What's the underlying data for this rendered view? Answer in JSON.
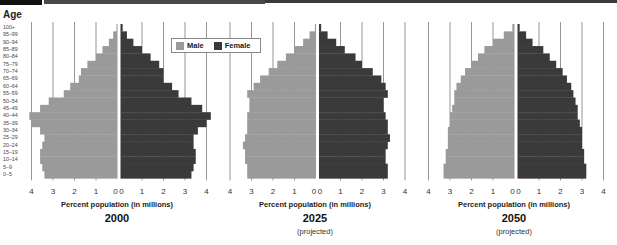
{
  "header": {
    "colors": {
      "black_block": "#111111",
      "gray_bar": "#4a4a4a",
      "thin_bar": "#3a3a3a"
    }
  },
  "y_axis": {
    "title": "Age",
    "age_groups_top_to_bottom": [
      "100+",
      "95–99",
      "90–94",
      "85–89",
      "80–84",
      "75–79",
      "70–74",
      "65–69",
      "60–64",
      "55–59",
      "50–54",
      "45–49",
      "40–44",
      "35–39",
      "30–34",
      "25–29",
      "20–24",
      "15–19",
      "10–14",
      "5–9",
      "0–5"
    ]
  },
  "legend": {
    "items": [
      {
        "label": "Male",
        "color": "#9a9a9a"
      },
      {
        "label": "Female",
        "color": "#3a3a3a"
      }
    ]
  },
  "chart_data": [
    {
      "type": "bar",
      "subtype": "population_pyramid",
      "title": "2000",
      "subtitle": "",
      "xlabel": "Percent population (in millions)",
      "ylabel": "Age",
      "x_ticks_left": [
        "4",
        "3",
        "2",
        "1",
        "0"
      ],
      "x_ticks_right": [
        "0",
        "1",
        "2",
        "3",
        "4"
      ],
      "xlim": [
        0,
        4
      ],
      "grid": true,
      "categories": [
        "0–5",
        "5–9",
        "10–14",
        "15–19",
        "20–24",
        "25–29",
        "30–34",
        "35–39",
        "40–44",
        "45–49",
        "50–54",
        "55–59",
        "60–64",
        "65–69",
        "70–74",
        "75–79",
        "80–84",
        "85–89",
        "90–94",
        "95–99",
        "100+"
      ],
      "series": [
        {
          "name": "Male",
          "color": "#9a9a9a",
          "values": [
            3.4,
            3.5,
            3.6,
            3.6,
            3.5,
            3.4,
            3.6,
            4.0,
            4.1,
            3.6,
            3.2,
            2.5,
            2.2,
            1.8,
            1.7,
            1.4,
            1.0,
            0.7,
            0.4,
            0.2,
            0.05
          ]
        },
        {
          "name": "Female",
          "color": "#3a3a3a",
          "values": [
            3.3,
            3.4,
            3.5,
            3.5,
            3.4,
            3.4,
            3.6,
            4.0,
            4.2,
            3.8,
            3.3,
            2.7,
            2.4,
            2.0,
            2.0,
            1.8,
            1.4,
            1.0,
            0.6,
            0.3,
            0.1
          ]
        }
      ]
    },
    {
      "type": "bar",
      "subtype": "population_pyramid",
      "title": "2025",
      "subtitle": "(projected)",
      "xlabel": "Percent population (in millions)",
      "ylabel": "Age",
      "x_ticks_left": [
        "4",
        "3",
        "2",
        "1",
        "0"
      ],
      "x_ticks_right": [
        "0",
        "1",
        "2",
        "3",
        "4"
      ],
      "xlim": [
        0,
        4
      ],
      "grid": true,
      "categories": [
        "0–5",
        "5–9",
        "10–14",
        "15–19",
        "20–24",
        "25–29",
        "30–34",
        "35–39",
        "40–44",
        "45–49",
        "50–54",
        "55–59",
        "60–64",
        "65–69",
        "70–74",
        "75–79",
        "80–84",
        "85–89",
        "90–94",
        "95–99",
        "100+"
      ],
      "series": [
        {
          "name": "Male",
          "color": "#9a9a9a",
          "values": [
            3.2,
            3.2,
            3.3,
            3.3,
            3.4,
            3.3,
            3.2,
            3.2,
            3.2,
            3.1,
            3.1,
            3.2,
            2.9,
            2.6,
            2.2,
            1.8,
            1.4,
            1.0,
            0.6,
            0.3,
            0.05
          ]
        },
        {
          "name": "Female",
          "color": "#3a3a3a",
          "values": [
            3.2,
            3.2,
            3.1,
            3.1,
            3.2,
            3.3,
            3.2,
            3.2,
            3.1,
            3.0,
            3.0,
            3.2,
            3.1,
            2.9,
            2.5,
            2.0,
            1.7,
            1.2,
            0.8,
            0.4,
            0.1
          ]
        }
      ]
    },
    {
      "type": "bar",
      "subtype": "population_pyramid",
      "title": "2050",
      "subtitle": "(projected)",
      "xlabel": "Percent population (in millions)",
      "ylabel": "Age",
      "x_ticks_left": [
        "4",
        "3",
        "2",
        "1",
        "0"
      ],
      "x_ticks_right": [
        "0",
        "1",
        "2",
        "3",
        "4"
      ],
      "xlim": [
        0,
        4
      ],
      "grid": true,
      "categories": [
        "0–5",
        "5–9",
        "10–14",
        "15–19",
        "20–24",
        "25–29",
        "30–34",
        "35–39",
        "40–44",
        "45–49",
        "50–54",
        "55–59",
        "60–64",
        "65–69",
        "70–74",
        "75–79",
        "80–84",
        "85–89",
        "90–94",
        "95–99",
        "100+"
      ],
      "series": [
        {
          "name": "Male",
          "color": "#9a9a9a",
          "values": [
            3.3,
            3.3,
            3.2,
            3.2,
            3.1,
            3.1,
            3.1,
            3.0,
            3.0,
            2.9,
            2.8,
            2.8,
            2.7,
            2.5,
            2.3,
            2.0,
            1.7,
            1.4,
            1.0,
            0.5,
            0.1
          ]
        },
        {
          "name": "Female",
          "color": "#3a3a3a",
          "values": [
            3.2,
            3.2,
            3.1,
            3.1,
            3.0,
            3.0,
            3.0,
            2.9,
            2.8,
            2.8,
            2.7,
            2.6,
            2.5,
            2.3,
            2.1,
            1.8,
            1.5,
            1.2,
            0.7,
            0.4,
            0.1
          ]
        }
      ]
    }
  ]
}
